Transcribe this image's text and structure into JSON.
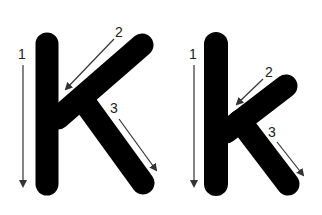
{
  "colors": {
    "letter": "#000000",
    "arrow": "#333333",
    "background": "#ffffff"
  },
  "letters": [
    {
      "name": "uppercase",
      "glyph": "K",
      "strokes": [
        {
          "order": "1",
          "direction": "down"
        },
        {
          "order": "2",
          "direction": "down-left"
        },
        {
          "order": "3",
          "direction": "down-right"
        }
      ]
    },
    {
      "name": "lowercase",
      "glyph": "k",
      "strokes": [
        {
          "order": "1",
          "direction": "down"
        },
        {
          "order": "2",
          "direction": "down-left"
        },
        {
          "order": "3",
          "direction": "down-right"
        }
      ]
    }
  ]
}
